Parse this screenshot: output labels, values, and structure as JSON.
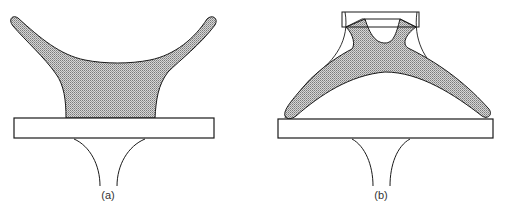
{
  "figure": {
    "panels": [
      {
        "id": "a",
        "label": "(a)",
        "description": "Y-shaped shaded body resting on a plate with a flared stem below"
      },
      {
        "id": "b",
        "label": "(b)",
        "description": "Arch-shaped shaded body within a trapezoidal outline on a plate with a flared stem below"
      }
    ]
  },
  "colors": {
    "outline": "#1a1a1a",
    "fill": "#b8b8b8",
    "background": "#ffffff"
  }
}
